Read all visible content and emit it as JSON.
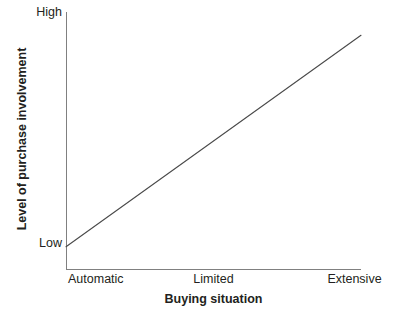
{
  "chart_data": {
    "type": "line",
    "title": "",
    "xlabel": "Buying situation",
    "ylabel": "Level of purchase involvement",
    "categories": [
      "Automatic",
      "Limited",
      "Extensive"
    ],
    "ytick_labels": [
      "Low",
      "High"
    ],
    "x": [
      0,
      1,
      2
    ],
    "series": [
      {
        "name": "Level of purchase involvement",
        "values": [
          0.09,
          0.5,
          0.91
        ]
      }
    ],
    "xlim": [
      0,
      2
    ],
    "ylim": [
      0,
      1
    ],
    "grid": false,
    "legend": "none",
    "line_color": "#4a4a4a",
    "axis_color": "#808080",
    "background_color": "#ffffff"
  },
  "axes": {
    "y_high_label": "High",
    "y_low_label": "Low",
    "x_left_label": "Automatic",
    "x_center_label": "Limited",
    "x_right_label": "Extensive",
    "x_title": "Buying situation",
    "y_title": "Level of purchase involvement"
  }
}
